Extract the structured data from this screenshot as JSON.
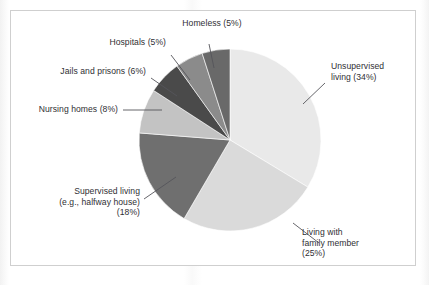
{
  "chart_data": {
    "type": "pie",
    "title": "",
    "subtitle": "",
    "xlabel": "",
    "ylabel": "",
    "legend_position": "none",
    "grid": false,
    "units": "percent",
    "total": 101,
    "start_angle_deg": 0,
    "direction": "clockwise",
    "categories": [
      "Unsupervised living",
      "Living with family member",
      "Supervised living (e.g., halfway house)",
      "Nursing homes",
      "Jails and prisons",
      "Hospitals",
      "Homeless"
    ],
    "values": [
      34,
      25,
      18,
      8,
      6,
      5,
      5
    ],
    "colors": [
      "#e9e9e9",
      "#dadada",
      "#6f6f6f",
      "#c3c3c3",
      "#4a4a4a",
      "#8b8b8b",
      "#696969"
    ],
    "slices": [
      {
        "key": "unsupervised-living",
        "label_lines": [
          "Unsupervised",
          "living (34%)"
        ],
        "label_text": "Unsupervised living (34%)",
        "value": 34,
        "value_text": "34%",
        "color": "#e9e9e9"
      },
      {
        "key": "living-with-family-member",
        "label_lines": [
          "Living with",
          "family member",
          "(25%)"
        ],
        "label_text": "Living with family member (25%)",
        "value": 25,
        "value_text": "25%",
        "color": "#dadada"
      },
      {
        "key": "supervised-living",
        "label_lines": [
          "Supervised living",
          "(e.g., halfway house)",
          "(18%)"
        ],
        "label_text": "Supervised living (e.g., halfway house) (18%)",
        "value": 18,
        "value_text": "18%",
        "color": "#6f6f6f"
      },
      {
        "key": "nursing-homes",
        "label_lines": [
          "Nursing homes (8%)"
        ],
        "label_text": "Nursing homes (8%)",
        "value": 8,
        "value_text": "8%",
        "color": "#c3c3c3"
      },
      {
        "key": "jails-and-prisons",
        "label_lines": [
          "Jails and prisons (6%)"
        ],
        "label_text": "Jails and prisons (6%)",
        "value": 6,
        "value_text": "6%",
        "color": "#4a4a4a"
      },
      {
        "key": "hospitals",
        "label_lines": [
          "Hospitals (5%)"
        ],
        "label_text": "Hospitals (5%)",
        "value": 5,
        "value_text": "5%",
        "color": "#8b8b8b"
      },
      {
        "key": "homeless",
        "label_lines": [
          "Homeless (5%)"
        ],
        "label_text": "Homeless (5%)",
        "value": 5,
        "value_text": "5%",
        "color": "#696969"
      }
    ]
  },
  "labels": {
    "unsupervised_living": "Unsupervised\nliving (34%)",
    "living_with_family_member": "Living with\nfamily member\n(25%)",
    "supervised_living": "Supervised living\n(e.g., halfway house)\n(18%)",
    "nursing_homes": "Nursing homes (8%)",
    "jails_and_prisons": "Jails and prisons (6%)",
    "hospitals": "Hospitals (5%)",
    "homeless": "Homeless (5%)"
  },
  "style": {
    "frame_color": "#cfcfcf",
    "background": "#ffffff",
    "text_color": "#2f2f33",
    "leader_color": "#55555a"
  }
}
